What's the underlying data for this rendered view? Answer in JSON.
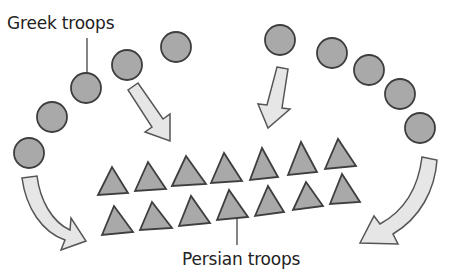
{
  "diagram": {
    "labels": {
      "greek": "Greek troops",
      "persian": "Persian troops"
    },
    "colors": {
      "unit_fill": "#a9a9a9",
      "unit_stroke": "#3e3e3e",
      "arrow_fill": "#e6e6e6",
      "arrow_stroke": "#555555",
      "text": "#222222"
    },
    "greek_troops": {
      "count": 10,
      "shape": "circle",
      "left_wing": [
        [
          29,
          153
        ],
        [
          52,
          117
        ],
        [
          86,
          88
        ],
        [
          127,
          65
        ],
        [
          176,
          47
        ]
      ],
      "right_wing": [
        [
          280,
          40
        ],
        [
          332,
          53
        ],
        [
          369,
          70
        ],
        [
          400,
          94
        ],
        [
          420,
          128
        ]
      ]
    },
    "persian_troops": {
      "count": 14,
      "shape": "triangle",
      "front_row": [
        [
          112,
          178
        ],
        [
          148,
          172
        ],
        [
          185,
          168
        ],
        [
          224,
          166
        ],
        [
          262,
          163
        ],
        [
          302,
          158
        ],
        [
          342,
          152
        ]
      ],
      "rear_row": [
        [
          118,
          218
        ],
        [
          156,
          214
        ],
        [
          195,
          210
        ],
        [
          233,
          207
        ],
        [
          271,
          202
        ],
        [
          309,
          198
        ],
        [
          345,
          192
        ]
      ]
    },
    "arrows": [
      {
        "name": "left-center-attack-arrow",
        "type": "straight",
        "from": [
          133,
          85
        ],
        "to": [
          170,
          140
        ]
      },
      {
        "name": "right-center-attack-arrow",
        "type": "straight",
        "from": [
          282,
          68
        ],
        "to": [
          268,
          127
        ]
      },
      {
        "name": "left-flank-envelop-arrow",
        "type": "curved",
        "from": [
          30,
          178
        ],
        "to": [
          83,
          240
        ]
      },
      {
        "name": "right-flank-envelop-arrow",
        "type": "curved",
        "from": [
          428,
          160
        ],
        "to": [
          362,
          243
        ]
      }
    ]
  }
}
